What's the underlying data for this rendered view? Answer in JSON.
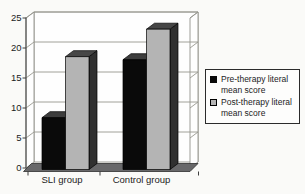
{
  "chart_data": {
    "type": "bar",
    "style": "3d-column",
    "title": "",
    "xlabel": "",
    "ylabel": "",
    "categories": [
      "SLI group",
      "Control group"
    ],
    "series": [
      {
        "name": "Pre-therapy literal mean score",
        "values": [
          8.5,
          18
        ],
        "color": "#0a0a0a",
        "color_top": "#3d3d3d",
        "color_side": "#1e1e1e"
      },
      {
        "name": "Post-therapy literal mean score",
        "values": [
          18.5,
          23
        ],
        "color": "#b4b4b4",
        "color_top": "#464646",
        "color_side": "#303030"
      }
    ],
    "ylim": [
      0,
      25
    ],
    "yticks": [
      0,
      5,
      10,
      15,
      20,
      25
    ],
    "grid": true,
    "legend_position": "right"
  },
  "colors": {
    "background": "#fafaf8",
    "wall": "#fefefe",
    "wall_border": "#85857f",
    "gridline": "#97978f",
    "floor": "#68686a",
    "floor_border": "#2f2f2f",
    "axis": "#3f3f3f",
    "bar_outline": "#000000",
    "text": "#1c1c1c",
    "legend_border": "#2b2b2b",
    "legend_bg": "#fdfdfc"
  }
}
